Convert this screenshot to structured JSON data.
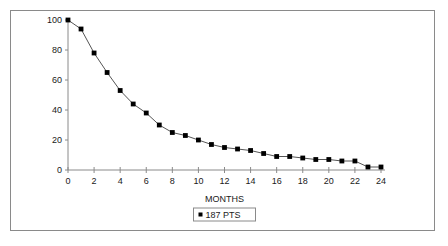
{
  "chart_data": {
    "type": "line",
    "title": "",
    "subtitle": "",
    "xlabel": "MONTHS",
    "ylabel": "",
    "xlim": [
      0,
      24
    ],
    "ylim": [
      0,
      100
    ],
    "xticks": [
      0,
      2,
      4,
      6,
      8,
      10,
      12,
      14,
      16,
      18,
      20,
      22,
      24
    ],
    "xtick_labels": [
      "0",
      "2",
      "4",
      "6",
      "8",
      "10",
      "12",
      "14",
      "16",
      "18",
      "20",
      "22",
      "24"
    ],
    "yticks": [
      0,
      20,
      40,
      60,
      80,
      100
    ],
    "ytick_labels": [
      "0",
      "20",
      "40",
      "60",
      "80",
      "100"
    ],
    "grid": false,
    "legend_position": "bottom",
    "marker": "square",
    "line_color": "#555555",
    "marker_color": "#000000",
    "series": [
      {
        "name": "187 PTS",
        "x": [
          0,
          1,
          2,
          3,
          4,
          5,
          6,
          7,
          8,
          9,
          10,
          11,
          12,
          13,
          14,
          15,
          16,
          17,
          18,
          19,
          20,
          21,
          22,
          23,
          24
        ],
        "values": [
          100,
          94,
          78,
          65,
          53,
          44,
          38,
          30,
          25,
          23,
          20,
          17,
          15,
          14,
          13,
          11,
          9,
          9,
          8,
          7,
          7,
          6,
          6,
          2,
          2
        ]
      }
    ]
  },
  "axis": {
    "x_title": "MONTHS"
  },
  "legend": {
    "entries": [
      {
        "label": "187 PTS",
        "marker": "square-marker",
        "color": "#000000"
      }
    ]
  }
}
